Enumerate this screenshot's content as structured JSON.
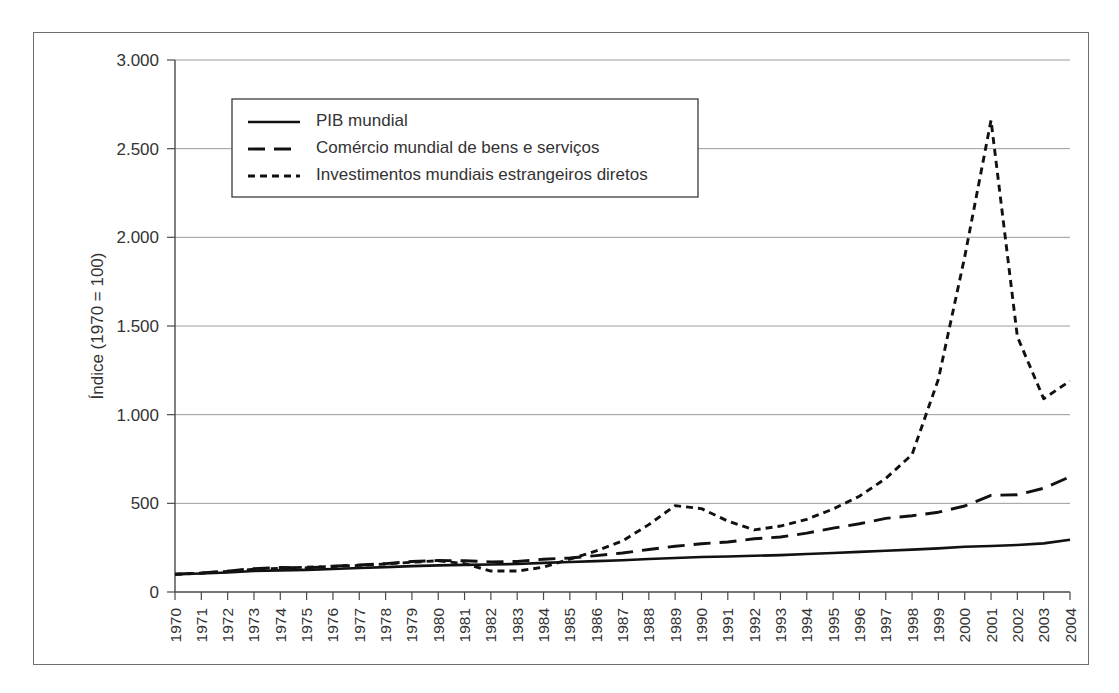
{
  "chart_data": {
    "type": "line",
    "title": "",
    "subtitle": "",
    "xlabel": "",
    "ylabel": "Índice (1970 = 100)",
    "ylim": [
      0,
      3000
    ],
    "yticks": [
      0,
      500,
      1000,
      1500,
      2000,
      2500,
      3000
    ],
    "ytick_labels": [
      "0",
      "500",
      "1.000",
      "1.500",
      "2.000",
      "2.500",
      "3.000"
    ],
    "grid": true,
    "grid_axis": "y",
    "legend_position": "upper left",
    "x": [
      1970,
      1971,
      1972,
      1973,
      1974,
      1975,
      1976,
      1977,
      1978,
      1979,
      1980,
      1981,
      1982,
      1983,
      1984,
      1985,
      1986,
      1987,
      1988,
      1989,
      1990,
      1991,
      1992,
      1993,
      1994,
      1995,
      1996,
      1997,
      1998,
      1999,
      2000,
      2001,
      2002,
      2003,
      2004
    ],
    "xtick_labels": [
      "1970",
      "1971",
      "1972",
      "1973",
      "1974",
      "1975",
      "1976",
      "1977",
      "1978",
      "1979",
      "1980",
      "1981",
      "1982",
      "1983",
      "1984",
      "1985",
      "1986",
      "1987",
      "1988",
      "1989",
      "1990",
      "1991",
      "1992",
      "1993",
      "1994",
      "1995",
      "1996",
      "1997",
      "1998",
      "1999",
      "2000",
      "2001",
      "2002",
      "2003",
      "2004"
    ],
    "series": [
      {
        "name": "PIB mundial",
        "style": "solid",
        "color": "#111111",
        "values": [
          100,
          104,
          110,
          118,
          122,
          125,
          130,
          135,
          140,
          146,
          150,
          153,
          155,
          158,
          164,
          169,
          174,
          179,
          186,
          192,
          197,
          200,
          204,
          208,
          214,
          220,
          226,
          233,
          239,
          246,
          255,
          259,
          265,
          274,
          295
        ]
      },
      {
        "name": "Comércio mundial de bens e serviços",
        "style": "dashed",
        "color": "#111111",
        "values": [
          100,
          108,
          118,
          132,
          138,
          136,
          146,
          152,
          160,
          172,
          178,
          176,
          170,
          172,
          185,
          192,
          205,
          220,
          240,
          258,
          272,
          282,
          300,
          310,
          332,
          360,
          385,
          415,
          430,
          450,
          485,
          545,
          548,
          585,
          650
        ]
      },
      {
        "name": "Investimentos mundiais estrangeiros diretos",
        "style": "dotted",
        "color": "#111111",
        "values": [
          100,
          106,
          116,
          128,
          134,
          140,
          144,
          150,
          158,
          168,
          176,
          160,
          118,
          118,
          140,
          185,
          232,
          288,
          380,
          487,
          470,
          400,
          350,
          372,
          410,
          468,
          540,
          640,
          775,
          1200,
          1890,
          2660,
          1440,
          1090,
          1190
        ]
      }
    ]
  },
  "legend": {
    "items": [
      {
        "label": "PIB mundial",
        "style": "solid"
      },
      {
        "label": "Comércio mundial de bens e serviços",
        "style": "dashed"
      },
      {
        "label": "Investimentos mundiais estrangeiros diretos",
        "style": "dotted"
      }
    ]
  }
}
